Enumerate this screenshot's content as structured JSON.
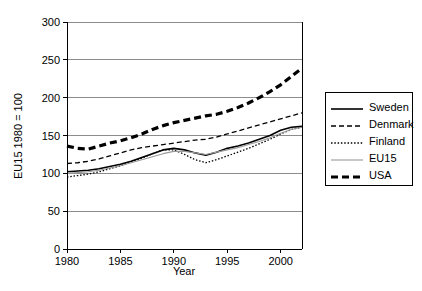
{
  "chart_data": {
    "type": "line",
    "title": "",
    "xlabel": "Year",
    "ylabel": "EU15 1980 = 100",
    "xlim": [
      1980,
      2002
    ],
    "ylim": [
      0,
      300
    ],
    "xticks": [
      1980,
      1985,
      1990,
      1995,
      2000
    ],
    "yticks": [
      0,
      50,
      100,
      150,
      200,
      250,
      300
    ],
    "grid": "horizontal",
    "legend_position": "right-outside",
    "x": [
      1980,
      1981,
      1982,
      1983,
      1984,
      1985,
      1986,
      1987,
      1988,
      1989,
      1990,
      1991,
      1992,
      1993,
      1994,
      1995,
      1996,
      1997,
      1998,
      1999,
      2000,
      2001,
      2002
    ],
    "series": [
      {
        "name": "Sweden",
        "style": "solid-thick",
        "color": "#000000",
        "values": [
          102,
          103,
          104,
          106,
          109,
          112,
          116,
          121,
          126,
          131,
          133,
          131,
          127,
          124,
          128,
          133,
          136,
          140,
          145,
          150,
          157,
          161,
          162
        ]
      },
      {
        "name": "Denmark",
        "style": "dashed",
        "color": "#000000",
        "values": [
          113,
          114,
          116,
          119,
          123,
          127,
          131,
          134,
          136,
          138,
          140,
          142,
          144,
          145,
          148,
          152,
          156,
          160,
          164,
          168,
          172,
          176,
          180
        ]
      },
      {
        "name": "Finland",
        "style": "dotted",
        "color": "#000000",
        "values": [
          95,
          97,
          99,
          102,
          106,
          110,
          115,
          120,
          126,
          131,
          131,
          125,
          118,
          114,
          118,
          123,
          128,
          133,
          139,
          145,
          152,
          158,
          161
        ]
      },
      {
        "name": "EU15",
        "style": "solid-thin",
        "color": "#9a9a9a",
        "values": [
          100,
          101,
          102,
          104,
          107,
          110,
          114,
          118,
          122,
          126,
          129,
          129,
          127,
          125,
          128,
          131,
          134,
          138,
          142,
          147,
          153,
          158,
          161
        ]
      },
      {
        "name": "USA",
        "style": "dashed-thick",
        "color": "#000000",
        "values": [
          136,
          133,
          132,
          136,
          140,
          143,
          147,
          152,
          158,
          163,
          167,
          170,
          173,
          176,
          178,
          182,
          187,
          193,
          200,
          208,
          217,
          228,
          239
        ]
      }
    ]
  },
  "legend": {
    "items": [
      {
        "label": "Sweden"
      },
      {
        "label": "Denmark"
      },
      {
        "label": "Finland"
      },
      {
        "label": "EU15"
      },
      {
        "label": "USA"
      }
    ]
  },
  "axes": {
    "y_title": "EU15 1980 = 100",
    "x_title": "Year",
    "y_tick_labels": [
      "300",
      "250",
      "200",
      "150",
      "100",
      "50",
      "0"
    ],
    "x_tick_labels": [
      "1980",
      "1985",
      "1990",
      "1995",
      "2000"
    ]
  }
}
